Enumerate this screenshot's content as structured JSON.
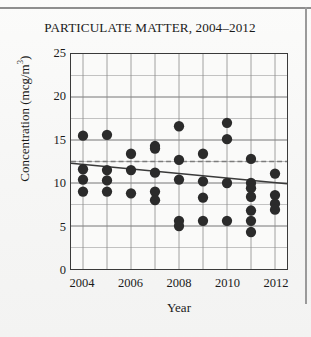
{
  "chart_data": {
    "type": "scatter",
    "title": "PARTICULATE MATTER, 2004–2012",
    "xlabel": "Year",
    "ylabel": "Concentration (mcg/m³)",
    "ylabel_main": "Concentration (mcg/m",
    "ylabel_sup": "3",
    "ylabel_tail": ")",
    "xlim": [
      2003.5,
      2012.5
    ],
    "ylim": [
      0,
      25
    ],
    "grid": true,
    "y_major_step": 5,
    "y_grid_step": 2.5,
    "x_grid_step": 1,
    "legend": "none",
    "ytick_labels": [
      "25",
      "20",
      "15",
      "10",
      "5",
      "0"
    ],
    "ytick_values": [
      25,
      20,
      15,
      10,
      5,
      0
    ],
    "xtick_labels": [
      "2004",
      "2006",
      "2008",
      "2010",
      "2012"
    ],
    "xtick_values": [
      2004,
      2006,
      2008,
      2010,
      2012
    ],
    "marker": {
      "shape": "circle",
      "color": "#2b2b2b",
      "size": 5.2
    },
    "points": [
      {
        "x": 2004,
        "y": 15.5
      },
      {
        "x": 2004,
        "y": 11.6
      },
      {
        "x": 2004,
        "y": 10.4
      },
      {
        "x": 2004,
        "y": 9.0
      },
      {
        "x": 2005,
        "y": 15.6
      },
      {
        "x": 2005,
        "y": 11.5
      },
      {
        "x": 2005,
        "y": 10.3
      },
      {
        "x": 2005,
        "y": 9.0
      },
      {
        "x": 2006,
        "y": 13.4
      },
      {
        "x": 2006,
        "y": 11.5
      },
      {
        "x": 2006,
        "y": 8.8
      },
      {
        "x": 2007,
        "y": 14.3
      },
      {
        "x": 2007,
        "y": 14.0
      },
      {
        "x": 2007,
        "y": 11.2
      },
      {
        "x": 2007,
        "y": 9.0
      },
      {
        "x": 2007,
        "y": 8.0
      },
      {
        "x": 2008,
        "y": 16.6
      },
      {
        "x": 2008,
        "y": 12.7
      },
      {
        "x": 2008,
        "y": 10.4
      },
      {
        "x": 2008,
        "y": 5.6
      },
      {
        "x": 2008,
        "y": 5.0
      },
      {
        "x": 2009,
        "y": 13.4
      },
      {
        "x": 2009,
        "y": 10.2
      },
      {
        "x": 2009,
        "y": 8.3
      },
      {
        "x": 2009,
        "y": 5.6
      },
      {
        "x": 2010,
        "y": 17.0
      },
      {
        "x": 2010,
        "y": 15.1
      },
      {
        "x": 2010,
        "y": 10.0
      },
      {
        "x": 2010,
        "y": 5.6
      },
      {
        "x": 2011,
        "y": 12.8
      },
      {
        "x": 2011,
        "y": 10.0
      },
      {
        "x": 2011,
        "y": 9.4
      },
      {
        "x": 2011,
        "y": 8.4
      },
      {
        "x": 2011,
        "y": 6.8
      },
      {
        "x": 2011,
        "y": 5.6
      },
      {
        "x": 2011,
        "y": 4.3
      },
      {
        "x": 2012,
        "y": 11.1
      },
      {
        "x": 2012,
        "y": 8.6
      },
      {
        "x": 2012,
        "y": 7.6
      },
      {
        "x": 2012,
        "y": 6.9
      }
    ],
    "trend_line": {
      "label": "trend line",
      "x_start": 2003.5,
      "y_start": 12.3,
      "x_end": 2012.5,
      "y_end": 9.9,
      "color": "#3a3a3a",
      "style": "solid"
    },
    "reference_line": {
      "label": "reference line",
      "y": 12.5,
      "color": "#7c7c7c",
      "style": "dashed"
    }
  }
}
